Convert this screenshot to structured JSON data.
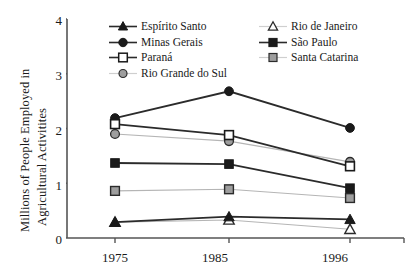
{
  "chart_data": {
    "type": "line",
    "title": "",
    "xlabel": "",
    "ylabel_line1": "Millions of People Employed in",
    "ylabel_line2": "Agricultural Activitites",
    "categories": [
      "1975",
      "1985",
      "1996"
    ],
    "x": [
      1975,
      1985,
      1996
    ],
    "ylim": [
      0,
      4
    ],
    "yticks": [
      "0",
      "1",
      "2",
      "3",
      "4"
    ],
    "grid": false,
    "legend_position": "top-inside",
    "series": [
      {
        "name": "Espírito Santo",
        "values": [
          0.29,
          0.39,
          0.34
        ],
        "marker": "filled-triangle",
        "marker_fill": "#1a1a1a",
        "line_color": "#2b2b2b"
      },
      {
        "name": "Minas Gerais",
        "values": [
          2.19,
          2.68,
          2.01
        ],
        "marker": "filled-circle",
        "marker_fill": "#1a1a1a",
        "line_color": "#2b2b2b"
      },
      {
        "name": "Paraná",
        "values": [
          2.08,
          1.88,
          1.31
        ],
        "marker": "open-square",
        "marker_fill": "#ffffff",
        "line_color": "#2b2b2b"
      },
      {
        "name": "Rio Grande do Sul",
        "values": [
          1.9,
          1.77,
          1.39
        ],
        "marker": "gray-circle",
        "marker_fill": "#9e9e9e",
        "line_color": "#b5b5b5"
      },
      {
        "name": "Rio de Janeiro",
        "values": [
          0.29,
          0.33,
          0.16
        ],
        "marker": "open-triangle",
        "marker_fill": "#ffffff",
        "line_color": "#b5b5b5"
      },
      {
        "name": "São Paulo",
        "values": [
          1.37,
          1.35,
          0.91
        ],
        "marker": "filled-square",
        "marker_fill": "#1a1a1a",
        "line_color": "#2b2b2b"
      },
      {
        "name": "Santa Catarina",
        "values": [
          0.86,
          0.89,
          0.73
        ],
        "marker": "gray-square",
        "marker_fill": "#9e9e9e",
        "line_color": "#b5b5b5"
      }
    ]
  },
  "legend": {
    "left_column": [
      "Espírito Santo",
      "Minas Gerais",
      "Paraná",
      "Rio Grande do Sul"
    ],
    "right_column": [
      "Rio de Janeiro",
      "São Paulo",
      "Santa Catarina"
    ]
  },
  "axis": {
    "y_tick_labels": [
      "4",
      "3",
      "2",
      "1",
      "0"
    ],
    "x_tick_labels": [
      "1975",
      "1985",
      "1996"
    ]
  },
  "colors": {
    "dark": "#2b2b2b",
    "light": "#b5b5b5",
    "gray_fill": "#9e9e9e",
    "axis": "#555555",
    "background": "#ffffff"
  }
}
